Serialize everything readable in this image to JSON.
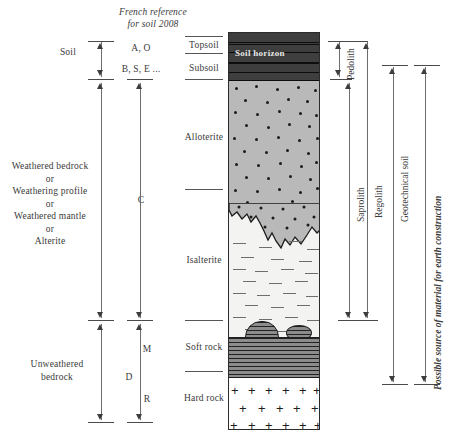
{
  "figure": {
    "header": {
      "line1": "French reference",
      "line2": "for soil 2008"
    },
    "column_profile": {
      "soil_horizon_label": "Soil horizon",
      "layers": [
        {
          "name": "Soil horizon",
          "pattern": "dark-banded",
          "top": 0,
          "height": 48
        },
        {
          "name": "Alloterite",
          "pattern": "stippled-grey",
          "top": 48,
          "height": 130
        },
        {
          "name": "Isalterite",
          "pattern": "dashed-light",
          "top": 178,
          "height": 140
        },
        {
          "name": "Soft rock",
          "pattern": "fine-lined-dark",
          "top": 296,
          "height": 44
        },
        {
          "name": "Hard rock",
          "pattern": "plus-symbols",
          "top": 340,
          "height": 58
        }
      ]
    },
    "left_column": {
      "items": [
        {
          "label": "Soil",
          "align": "right"
        },
        {
          "label": "Weathered bedrock\nor\nWeathering profile\nor\nWeathered mantle\nor\nAlterite",
          "align": "center"
        },
        {
          "label": "Unweathered\nbedrock",
          "align": "center"
        }
      ]
    },
    "horizon_codes": {
      "items": [
        {
          "label": "A, O"
        },
        {
          "label": "B, S, E ..."
        },
        {
          "label": "C"
        },
        {
          "label": "M"
        },
        {
          "label": "D"
        },
        {
          "label": "R"
        }
      ]
    },
    "layer_names": {
      "items": [
        {
          "label": "Topsoil"
        },
        {
          "label": "Subsoil"
        },
        {
          "label": "Alloterite"
        },
        {
          "label": "Isalterite"
        },
        {
          "label": "Soft rock"
        },
        {
          "label": "Hard rock"
        }
      ]
    },
    "right_brackets": {
      "items": [
        {
          "label": "Pedolith"
        },
        {
          "label": "Saprolith"
        },
        {
          "label": "Regolith"
        },
        {
          "label": "Geotechnical soil"
        },
        {
          "label": "Possible source of material for earth construction",
          "italic": true
        }
      ]
    },
    "colors": {
      "ink": "#333333",
      "rule": "#4a4a4a",
      "soil_band": "#3e3e3e",
      "alloterite": "#b9b9b9",
      "isalterite": "#f3f3f1",
      "soft_rock": "#8c8c8c",
      "hard_rock": "#ffffff"
    }
  }
}
